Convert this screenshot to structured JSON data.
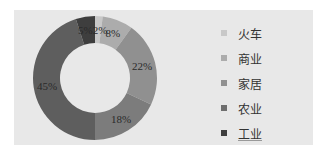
{
  "chart_data": {
    "type": "pie",
    "subtype": "donut",
    "title": "",
    "slices": [
      {
        "label": "火车",
        "value": 2,
        "display": "2%",
        "color": "#c8c8c8"
      },
      {
        "label": "商业",
        "value": 8,
        "display": "8%",
        "color": "#acacac"
      },
      {
        "label": "家居",
        "value": 22,
        "display": "22%",
        "color": "#909090"
      },
      {
        "label": "农业",
        "value": 18,
        "display": "18%",
        "color": "#7c7c7c"
      },
      {
        "label": "工业",
        "value": 45,
        "display": "45%",
        "color": "#5e5e5e"
      },
      {
        "label": "",
        "value": 5,
        "display": "5%",
        "color": "#3e3e3e"
      }
    ],
    "legend_position": "right",
    "start_angle": "12 o'clock, clockwise"
  },
  "legend": {
    "items": [
      {
        "label": "火车",
        "color": "#c8c8c8"
      },
      {
        "label": "商业",
        "color": "#acacac"
      },
      {
        "label": "家居",
        "color": "#909090"
      },
      {
        "label": "农业",
        "color": "#6e6e6e"
      },
      {
        "label": "工业",
        "color": "#3e3e3e"
      }
    ]
  }
}
